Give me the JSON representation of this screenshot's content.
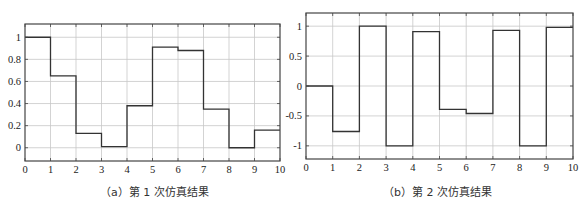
{
  "chart_data": [
    {
      "type": "line",
      "step": "post",
      "caption": "（a）第 1 次仿真结果",
      "x": [
        0,
        1,
        2,
        3,
        4,
        5,
        6,
        7,
        8,
        9,
        10
      ],
      "values": [
        1.0,
        0.65,
        0.13,
        0.01,
        0.38,
        0.91,
        0.88,
        0.35,
        0.0,
        0.16
      ],
      "xlim": [
        0,
        10
      ],
      "ylim": [
        -0.12,
        1.12
      ],
      "xticks": [
        "0",
        "1",
        "2",
        "3",
        "4",
        "5",
        "6",
        "7",
        "8",
        "9",
        "10"
      ],
      "yticks": [
        "0",
        "0.2",
        "0.4",
        "0.6",
        "0.8",
        "1"
      ],
      "ytick_values": [
        0,
        0.2,
        0.4,
        0.6,
        0.8,
        1
      ],
      "grid": true,
      "xlabel": "",
      "ylabel": "",
      "title": ""
    },
    {
      "type": "line",
      "step": "post",
      "caption": "（b）第 2 次仿真结果",
      "x": [
        0,
        1,
        2,
        3,
        4,
        5,
        6,
        7,
        8,
        9,
        10
      ],
      "values": [
        0.0,
        -0.76,
        1.0,
        -1.0,
        0.91,
        -0.39,
        -0.46,
        0.93,
        -1.0,
        0.98
      ],
      "xlim": [
        0,
        10
      ],
      "ylim": [
        -1.22,
        1.22
      ],
      "xticks": [
        "0",
        "1",
        "2",
        "3",
        "4",
        "5",
        "6",
        "7",
        "8",
        "9",
        "10"
      ],
      "yticks": [
        "-1",
        "-0.5",
        "0",
        "0.5",
        "1"
      ],
      "ytick_values": [
        -1,
        -0.5,
        0,
        0.5,
        1
      ],
      "grid": true,
      "xlabel": "",
      "ylabel": "",
      "title": ""
    }
  ],
  "colors": {
    "line": "#333333",
    "grid": "#c8c8c8",
    "axis": "#444444"
  }
}
